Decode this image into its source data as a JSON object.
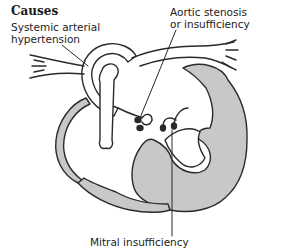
{
  "diagram": {
    "title": "Causes",
    "labels": {
      "hypertension": [
        "Systemic arterial",
        "hypertension"
      ],
      "aortic": [
        "Aortic stenosis",
        "or insufficiency"
      ],
      "mitral": "Mitral insufficiency"
    },
    "colors": {
      "myocardium": "#c8c8c8",
      "outline": "#2a2a2a",
      "background": "#ffffff"
    }
  }
}
